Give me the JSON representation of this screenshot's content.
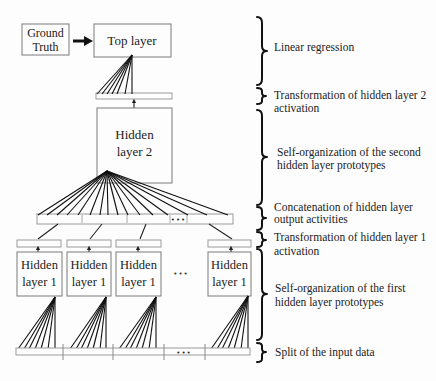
{
  "diagram": {
    "nodes": {
      "ground_truth": {
        "line1": "Ground",
        "line2": "Truth"
      },
      "top_layer": {
        "label": "Top layer"
      },
      "hidden_layer_2": {
        "line1": "Hidden",
        "line2": "layer 2"
      },
      "hidden_layer_1": [
        {
          "line1": "Hidden",
          "line2": "layer 1"
        },
        {
          "line1": "Hidden",
          "line2": "layer 1"
        },
        {
          "line1": "Hidden",
          "line2": "layer 1"
        },
        {
          "line1": "Hidden",
          "line2": "layer 1"
        }
      ],
      "between_boxes_ellipsis": "•••",
      "concat_ellipsis": "•••",
      "input_ellipsis": "•••"
    },
    "annotations": [
      {
        "lines": [
          "Linear regression"
        ]
      },
      {
        "lines": [
          "Transformation of hidden layer 2",
          "activation"
        ]
      },
      {
        "lines": [
          "Self-organization of the second",
          "hidden layer prototypes"
        ]
      },
      {
        "lines": [
          "Concatenation of hidden layer",
          "output activities"
        ]
      },
      {
        "lines": [
          "Transformation of hidden layer 1",
          "activation"
        ]
      },
      {
        "lines": [
          "Self-organization of the first",
          "hidden layer prototypes"
        ]
      },
      {
        "lines": [
          "Split of the input data"
        ]
      }
    ]
  }
}
